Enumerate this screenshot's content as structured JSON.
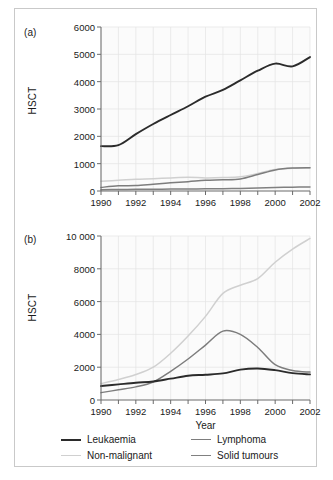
{
  "figure": {
    "panels": [
      {
        "tag": "(a)",
        "ylabel": "HSCT",
        "xlabel": "",
        "ylim": [
          0,
          6000
        ],
        "yticks": [
          0,
          1000,
          2000,
          3000,
          4000,
          5000,
          6000
        ],
        "ytick_labels": [
          "0",
          "1000",
          "2000",
          "3000",
          "4000",
          "5000",
          "6000"
        ],
        "xlim": [
          1990,
          2002
        ],
        "xticks": [
          1990,
          1992,
          1994,
          1996,
          1998,
          2000,
          2002
        ],
        "xtick_labels": [
          "1990",
          "1992",
          "1994",
          "1996",
          "1998",
          "2000",
          "2002"
        ]
      },
      {
        "tag": "(b)",
        "ylabel": "HSCT",
        "xlabel": "Year",
        "ylim": [
          0,
          10000
        ],
        "yticks": [
          0,
          2000,
          4000,
          6000,
          8000,
          10000
        ],
        "ytick_labels": [
          "0",
          "2000",
          "4000",
          "6000",
          "8000",
          "10 000"
        ],
        "xlim": [
          1990,
          2002
        ],
        "xticks": [
          1990,
          1992,
          1994,
          1996,
          1998,
          2000,
          2002
        ],
        "xtick_labels": [
          "1990",
          "1992",
          "1994",
          "1996",
          "1998",
          "2000",
          "2002"
        ]
      }
    ],
    "legend": {
      "position": "bottom",
      "entries": [
        {
          "label": "Leukaemia",
          "color": "#2b2b2b"
        },
        {
          "label": "Non-malignant",
          "color": "#d0d0d0"
        },
        {
          "label": "Lymphoma",
          "color": "#7d7d7d"
        },
        {
          "label": "Solid tumours",
          "color": "#808080"
        }
      ]
    },
    "colors": {
      "leukaemia": "#2b2b2b",
      "non_malignant": "#d0d0d0",
      "lymphoma": "#7d7d7d",
      "solid_tumours": "#808080",
      "axis": "#6b6b6b",
      "grid": "#e4e4e4",
      "plot_background": "#fbfbfb",
      "text": "#1a1a1a",
      "frame": "#c9c9c9"
    }
  },
  "chart_data": [
    {
      "type": "line",
      "title": "(a)",
      "xlabel": "",
      "ylabel": "HSCT",
      "xlim": [
        1990,
        2002
      ],
      "ylim": [
        0,
        6000
      ],
      "grid": true,
      "legend_position": "bottom",
      "x": [
        1990,
        1991,
        1992,
        1993,
        1994,
        1995,
        1996,
        1997,
        1998,
        1999,
        2000,
        2001,
        2002
      ],
      "series": [
        {
          "name": "Leukaemia",
          "color": "#2b2b2b",
          "values": [
            1640,
            1680,
            2080,
            2450,
            2780,
            3100,
            3450,
            3700,
            4050,
            4400,
            4660,
            4560,
            4900
          ]
        },
        {
          "name": "Non-malignant",
          "color": "#d0d0d0",
          "values": [
            360,
            390,
            430,
            450,
            480,
            500,
            480,
            490,
            520,
            640,
            790,
            830,
            840
          ]
        },
        {
          "name": "Lymphoma",
          "color": "#7d7d7d",
          "values": [
            130,
            190,
            200,
            250,
            300,
            340,
            390,
            410,
            440,
            600,
            770,
            840,
            850
          ]
        },
        {
          "name": "Solid tumours",
          "color": "#808080",
          "values": [
            50,
            55,
            60,
            65,
            70,
            75,
            80,
            85,
            95,
            110,
            125,
            140,
            150
          ]
        }
      ]
    },
    {
      "type": "line",
      "title": "(b)",
      "xlabel": "Year",
      "ylabel": "HSCT",
      "xlim": [
        1990,
        2002
      ],
      "ylim": [
        0,
        10000
      ],
      "grid": true,
      "legend_position": "bottom",
      "x": [
        1990,
        1991,
        1992,
        1993,
        1994,
        1995,
        1996,
        1997,
        1998,
        1999,
        2000,
        2001,
        2002
      ],
      "series": [
        {
          "name": "Leukaemia",
          "color": "#2b2b2b",
          "values": [
            850,
            950,
            1050,
            1130,
            1300,
            1480,
            1540,
            1620,
            1850,
            1920,
            1820,
            1640,
            1560
          ]
        },
        {
          "name": "Non-malignant",
          "color": "#d0d0d0",
          "values": [
            1000,
            1250,
            1550,
            2000,
            2850,
            3900,
            5100,
            6500,
            7000,
            7400,
            8400,
            9200,
            9850
          ]
        },
        {
          "name": "Lymphoma",
          "color": "#7d7d7d",
          "values": [
            450,
            620,
            800,
            1100,
            1750,
            2500,
            3350,
            4200,
            4000,
            3200,
            2150,
            1800,
            1700
          ]
        },
        {
          "name": "Solid tumours",
          "color": "#808080",
          "values": []
        }
      ]
    }
  ]
}
